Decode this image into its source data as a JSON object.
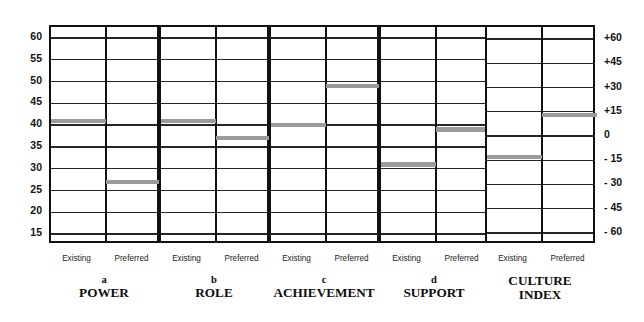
{
  "figure": {
    "left_axis_ticks": [
      "60",
      "55",
      "50",
      "45",
      "40",
      "35",
      "30",
      "25",
      "20",
      "15"
    ],
    "right_axis_ticks": [
      "+60",
      "+45",
      "+30",
      "+15",
      "0",
      "- 15",
      "- 30",
      "- 45",
      "- 60"
    ],
    "column_labels": [
      "Existing",
      "Preferred"
    ],
    "bar_color": "#9b9b9b",
    "line_color": "#262626",
    "frame_color": "#111111"
  },
  "groups": [
    {
      "letter": "a",
      "name": "POWER",
      "existing": 41,
      "preferred": 27
    },
    {
      "letter": "b",
      "name": "ROLE",
      "existing": 41,
      "preferred": 37
    },
    {
      "letter": "c",
      "name": "ACHIEVEMENT",
      "existing": 40,
      "preferred": 49
    },
    {
      "letter": "d",
      "name": "SUPPORT",
      "existing": 31,
      "preferred": 39
    }
  ],
  "culture_index": {
    "letter": "",
    "name_line1": "CULTURE",
    "name_line2": "INDEX",
    "existing": -13,
    "preferred": 13
  },
  "chart_data": {
    "type": "bar",
    "title": "",
    "subtitle": "",
    "xlabel": "",
    "ylabel": "",
    "grid": true,
    "legend": "none",
    "panels": [
      {
        "panel": "a",
        "name": "POWER",
        "categories": [
          "Existing",
          "Preferred"
        ],
        "values": [
          41,
          27
        ],
        "ylim": [
          12.5,
          62.5
        ],
        "yticks": [
          15,
          20,
          25,
          30,
          35,
          40,
          45,
          50,
          55,
          60
        ]
      },
      {
        "panel": "b",
        "name": "ROLE",
        "categories": [
          "Existing",
          "Preferred"
        ],
        "values": [
          41,
          37
        ],
        "ylim": [
          12.5,
          62.5
        ],
        "yticks": [
          15,
          20,
          25,
          30,
          35,
          40,
          45,
          50,
          55,
          60
        ]
      },
      {
        "panel": "c",
        "name": "ACHIEVEMENT",
        "categories": [
          "Existing",
          "Preferred"
        ],
        "values": [
          40,
          49
        ],
        "ylim": [
          12.5,
          62.5
        ],
        "yticks": [
          15,
          20,
          25,
          30,
          35,
          40,
          45,
          50,
          55,
          60
        ]
      },
      {
        "panel": "d",
        "name": "SUPPORT",
        "categories": [
          "Existing",
          "Preferred"
        ],
        "values": [
          31,
          39
        ],
        "ylim": [
          12.5,
          62.5
        ],
        "yticks": [
          15,
          20,
          25,
          30,
          35,
          40,
          45,
          50,
          55,
          60
        ]
      },
      {
        "panel": "",
        "name": "CULTURE INDEX",
        "categories": [
          "Existing",
          "Preferred"
        ],
        "values": [
          -13,
          13
        ],
        "ylim": [
          -67.5,
          67.5
        ],
        "yticks": [
          -60,
          -45,
          -30,
          -15,
          0,
          15,
          30,
          45,
          60
        ]
      }
    ]
  }
}
